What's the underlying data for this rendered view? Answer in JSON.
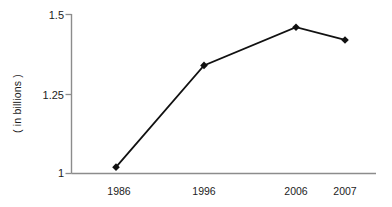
{
  "chart_data": {
    "type": "line",
    "title": "",
    "subtitle": "",
    "xlabel": "",
    "ylabel": "( in billions )",
    "categories": [
      "1986",
      "1996",
      "2006",
      "2007"
    ],
    "x": [
      1986,
      1996,
      2006,
      2007
    ],
    "values": [
      1.02,
      1.34,
      1.46,
      1.42
    ],
    "series": [
      {
        "name": "",
        "values": [
          1.02,
          1.34,
          1.46,
          1.42
        ]
      }
    ],
    "ylim": [
      1,
      1.5
    ],
    "y_ticks": [
      "1.5",
      "1.25",
      "1"
    ],
    "y_tick_values": [
      1.5,
      1.25,
      1
    ],
    "x_ticks": [
      "1986",
      "1996",
      "2006",
      "2007"
    ],
    "grid": false,
    "legend": false,
    "legend_position": "none",
    "marker": "diamond",
    "line_color": "#111111",
    "marker_color": "#111111",
    "axis_color": "#8c8c8c",
    "text_color": "#1c1c1c",
    "background_color": "#ffffff",
    "annotations": []
  },
  "axis": {
    "y_label": "( in billions )",
    "y_ticks": [
      {
        "label": "1.5"
      },
      {
        "label": "1.25"
      },
      {
        "label": "1"
      }
    ],
    "x_ticks": [
      {
        "label": "1986"
      },
      {
        "label": "1996"
      },
      {
        "label": "2006"
      },
      {
        "label": "2007"
      }
    ]
  }
}
